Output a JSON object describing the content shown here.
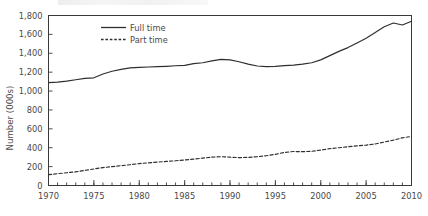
{
  "chart_data": {
    "type": "line",
    "title": "",
    "xlabel": "",
    "ylabel": "Number (000s)",
    "xlim": [
      1970,
      2010
    ],
    "ylim": [
      0,
      1800
    ],
    "ytick_labels": [
      "0",
      "200",
      "400",
      "600",
      "800",
      "1,000",
      "1,200",
      "1,400",
      "1,600",
      "1,800"
    ],
    "ytick_values": [
      0,
      200,
      400,
      600,
      800,
      1000,
      1200,
      1400,
      1600,
      1800
    ],
    "xtick_labels": [
      "1970",
      "1975",
      "1980",
      "1985",
      "1990",
      "1995",
      "2000",
      "2005",
      "2010"
    ],
    "xtick_values": [
      1970,
      1975,
      1980,
      1985,
      1990,
      1995,
      2000,
      2005,
      2010
    ],
    "minor_xtick_interval": 1,
    "grid": false,
    "legend_position": "top-left-inside",
    "x": [
      1970,
      1971,
      1972,
      1973,
      1974,
      1975,
      1976,
      1977,
      1978,
      1979,
      1980,
      1981,
      1982,
      1983,
      1984,
      1985,
      1986,
      1987,
      1988,
      1989,
      1990,
      1991,
      1992,
      1993,
      1994,
      1995,
      1996,
      1997,
      1998,
      1999,
      2000,
      2001,
      2002,
      2003,
      2004,
      2005,
      2006,
      2007,
      2008,
      2009,
      2010
    ],
    "series": [
      {
        "name": "Full time",
        "style": "solid",
        "color": "#2e2e2e",
        "values": [
          1090,
          1095,
          1105,
          1120,
          1135,
          1140,
          1180,
          1210,
          1230,
          1245,
          1250,
          1255,
          1258,
          1262,
          1268,
          1272,
          1290,
          1300,
          1320,
          1335,
          1330,
          1310,
          1285,
          1265,
          1258,
          1262,
          1270,
          1275,
          1285,
          1300,
          1330,
          1375,
          1420,
          1460,
          1510,
          1560,
          1620,
          1680,
          1720,
          1700,
          1740
        ]
      },
      {
        "name": "Part time",
        "style": "dashed",
        "color": "#2e2e2e",
        "values": [
          115,
          125,
          135,
          145,
          160,
          175,
          190,
          200,
          210,
          220,
          232,
          240,
          248,
          255,
          262,
          270,
          280,
          290,
          300,
          305,
          300,
          295,
          298,
          305,
          315,
          330,
          350,
          360,
          358,
          362,
          375,
          390,
          400,
          410,
          420,
          428,
          440,
          460,
          480,
          505,
          520
        ]
      }
    ]
  },
  "legend": {
    "entries": [
      {
        "label": "Full time",
        "style": "solid"
      },
      {
        "label": "Part time",
        "style": "dashed"
      }
    ]
  },
  "axes": {
    "y_title": "Number (000s)"
  }
}
